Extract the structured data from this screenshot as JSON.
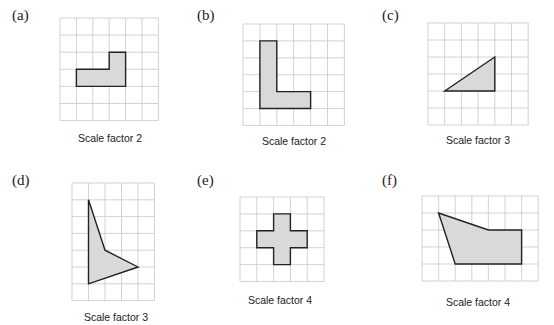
{
  "style": {
    "grid_color": "#c8c8c8",
    "shape_fill": "#d9d9d9",
    "shape_stroke": "#222222"
  },
  "panels": [
    {
      "label": "(a)",
      "caption": "Scale factor 2",
      "label_pos": [
        12,
        23
      ],
      "caption_pos": [
        110,
        132
      ],
      "grid": {
        "x": 60,
        "y": 18,
        "cols": 6,
        "rows": 6,
        "cw": 16.4,
        "ch": 17.1
      },
      "shape": [
        [
          1,
          3
        ],
        [
          3,
          3
        ],
        [
          3,
          2
        ],
        [
          4,
          2
        ],
        [
          4,
          4
        ],
        [
          1,
          4
        ]
      ]
    },
    {
      "label": "(b)",
      "caption": "Scale factor 2",
      "label_pos": [
        197,
        23
      ],
      "caption_pos": [
        294,
        135
      ],
      "grid": {
        "x": 243,
        "y": 24,
        "cols": 6,
        "rows": 6,
        "cw": 16.9,
        "ch": 16.9
      },
      "shape": [
        [
          1,
          1
        ],
        [
          2,
          1
        ],
        [
          2,
          4
        ],
        [
          4,
          4
        ],
        [
          4,
          5
        ],
        [
          1,
          5
        ]
      ]
    },
    {
      "label": "(c)",
      "caption": "Scale factor 3",
      "label_pos": [
        382,
        23
      ],
      "caption_pos": [
        478,
        134
      ],
      "grid": {
        "x": 428,
        "y": 23,
        "cols": 6,
        "rows": 6,
        "cw": 16.7,
        "ch": 17.0
      },
      "shape": [
        [
          1,
          4
        ],
        [
          4,
          4
        ],
        [
          4,
          2
        ]
      ]
    },
    {
      "label": "(d)",
      "caption": "Scale factor 3",
      "label_pos": [
        12,
        188
      ],
      "caption_pos": [
        116,
        311
      ],
      "grid": {
        "x": 72,
        "y": 183,
        "cols": 5,
        "rows": 7,
        "cw": 16.5,
        "ch": 16.8
      },
      "shape": [
        [
          1,
          1
        ],
        [
          2,
          4
        ],
        [
          4,
          5
        ],
        [
          1,
          6
        ]
      ]
    },
    {
      "label": "(e)",
      "caption": "Scale factor 4",
      "label_pos": [
        197,
        188
      ],
      "caption_pos": [
        280,
        294
      ],
      "grid": {
        "x": 240,
        "y": 197,
        "cols": 5,
        "rows": 5,
        "cw": 16.8,
        "ch": 16.9
      },
      "shape": [
        [
          2,
          1
        ],
        [
          3,
          1
        ],
        [
          3,
          2
        ],
        [
          4,
          2
        ],
        [
          4,
          3
        ],
        [
          3,
          3
        ],
        [
          3,
          4
        ],
        [
          2,
          4
        ],
        [
          2,
          3
        ],
        [
          1,
          3
        ],
        [
          1,
          2
        ],
        [
          2,
          2
        ]
      ]
    },
    {
      "label": "(f)",
      "caption": "Scale factor 4",
      "label_pos": [
        382,
        188
      ],
      "caption_pos": [
        478,
        296
      ],
      "grid": {
        "x": 422,
        "y": 196,
        "cols": 7,
        "rows": 5,
        "cw": 16.6,
        "ch": 17.0
      },
      "shape": [
        [
          1,
          1
        ],
        [
          4,
          2
        ],
        [
          6,
          2
        ],
        [
          6,
          4
        ],
        [
          2,
          4
        ]
      ]
    }
  ]
}
